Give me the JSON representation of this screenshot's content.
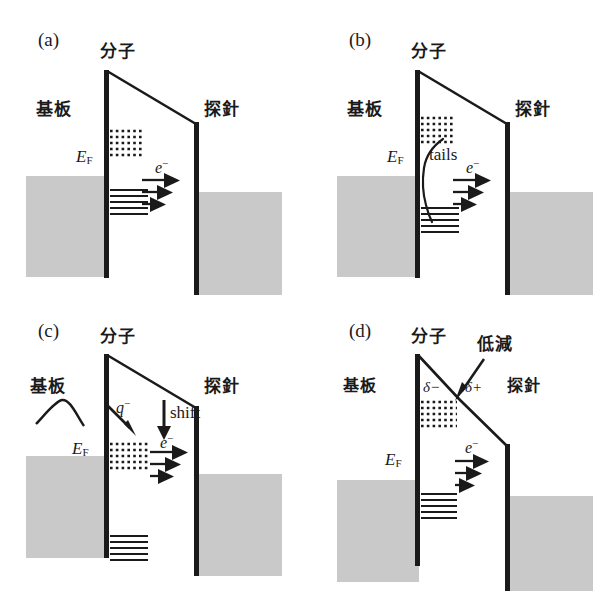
{
  "figure": {
    "colors": {
      "electrode_fill": "#c9c9c9",
      "line": "#1a1a1a",
      "background": "#ffffff"
    }
  },
  "panels": [
    {
      "tag": "(a)",
      "labels": {
        "molecule": "分子",
        "substrate": "基板",
        "tip": "探針",
        "fermi": "E",
        "fermi_sub": "F",
        "electron": "e",
        "electron_sup": "−"
      },
      "features": {
        "dotted_levels": 5,
        "solid_levels": 5,
        "tunnel_arrows": 3,
        "barrier_shape": "linear-slope"
      }
    },
    {
      "tag": "(b)",
      "labels": {
        "molecule": "分子",
        "substrate": "基板",
        "tip": "探針",
        "fermi": "E",
        "fermi_sub": "F",
        "electron": "e",
        "electron_sup": "−",
        "tails": "tails"
      },
      "features": {
        "dotted_levels": 5,
        "solid_levels": 5,
        "tunnel_arrows": 3,
        "barrier_shape": "linear-slope",
        "tail_curve": true
      }
    },
    {
      "tag": "(c)",
      "labels": {
        "molecule": "分子",
        "substrate": "基板",
        "tip": "探針",
        "fermi": "E",
        "fermi_sub": "F",
        "electron": "e",
        "electron_sup": "−",
        "charge": "q",
        "charge_sup": "−",
        "shift": "shift"
      },
      "features": {
        "dotted_levels": 5,
        "solid_levels": 5,
        "tunnel_arrows": 3,
        "barrier_shape": "linear-slope",
        "charge_transfer_arrow": true,
        "shift_arrow": true
      }
    },
    {
      "tag": "(d)",
      "labels": {
        "molecule": "分子",
        "substrate": "基板",
        "tip": "探針",
        "fermi": "E",
        "fermi_sub": "F",
        "electron": "e",
        "electron_sup": "−",
        "reduction": "低減",
        "delta_minus": "δ−",
        "delta_plus": "δ+"
      },
      "features": {
        "dotted_levels": 5,
        "solid_levels": 5,
        "tunnel_arrows": 3,
        "barrier_shape": "kinked-lowered",
        "reduction_arrow": true
      }
    }
  ]
}
